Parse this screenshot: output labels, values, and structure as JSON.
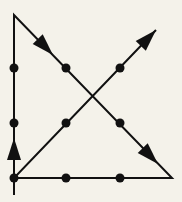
{
  "diagram": {
    "title": "Nine dots puzzle solution",
    "background": "#f4f2ea",
    "ink": "#111111",
    "dots": [
      {
        "x": 14,
        "y": 68
      },
      {
        "x": 66,
        "y": 68
      },
      {
        "x": 120,
        "y": 68
      },
      {
        "x": 14,
        "y": 123
      },
      {
        "x": 66,
        "y": 123
      },
      {
        "x": 120,
        "y": 123
      },
      {
        "x": 14,
        "y": 178
      },
      {
        "x": 66,
        "y": 178
      },
      {
        "x": 120,
        "y": 178
      }
    ],
    "path": [
      {
        "x": 14,
        "y": 195
      },
      {
        "x": 14,
        "y": 15
      },
      {
        "x": 172,
        "y": 178
      },
      {
        "x": 14,
        "y": 178
      },
      {
        "x": 156,
        "y": 30
      }
    ],
    "arrows": [
      {
        "name": "arrow-up-left-edge",
        "tip": {
          "x": 14,
          "y": 138
        },
        "dir": {
          "x": 0,
          "y": -1
        }
      },
      {
        "name": "arrow-down-right-upper",
        "tip": {
          "x": 53,
          "y": 55
        },
        "dir": {
          "x": 0.696,
          "y": 0.718
        }
      },
      {
        "name": "arrow-down-right-lower",
        "tip": {
          "x": 158,
          "y": 164
        },
        "dir": {
          "x": 0.696,
          "y": 0.718
        }
      },
      {
        "name": "arrow-up-right",
        "tip": {
          "x": 156,
          "y": 30
        },
        "dir": {
          "x": 0.693,
          "y": -0.721
        }
      }
    ]
  }
}
